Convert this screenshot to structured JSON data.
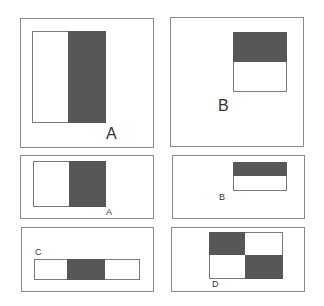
{
  "figure": {
    "colors": {
      "frame_border": "#8a8a8a",
      "dark_fill": "#575757",
      "light_fill": "#ffffff"
    },
    "panels": [
      {
        "id": "panel-1",
        "label": "A",
        "feature": "two-rectangle vertical (left light, right dark)"
      },
      {
        "id": "panel-2",
        "label": "B",
        "feature": "two-rectangle horizontal (top dark, bottom light)"
      },
      {
        "id": "panel-3",
        "label": "A",
        "feature": "two-rectangle vertical (left light, right dark)"
      },
      {
        "id": "panel-4",
        "label": "B",
        "feature": "two-rectangle horizontal (top dark, bottom light)"
      },
      {
        "id": "panel-5",
        "label": "C",
        "feature": "three-rectangle (light, dark, light)"
      },
      {
        "id": "panel-6",
        "label": "D",
        "feature": "four-rectangle checkerboard"
      }
    ]
  }
}
